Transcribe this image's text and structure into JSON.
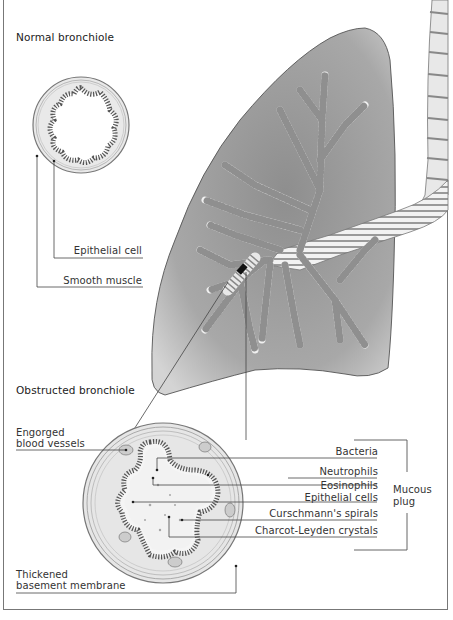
{
  "titles": {
    "normal": "Normal bronchiole",
    "obstructed": "Obstructed bronchiole"
  },
  "normal_labels": {
    "epithelial_cell": "Epithelial cell",
    "smooth_muscle": "Smooth muscle"
  },
  "obstructed_left_labels": {
    "engorged_1": "Engorged",
    "engorged_2": "blood vessels",
    "thickened_1": "Thickened",
    "thickened_2": "basement membrane"
  },
  "mucous_plug_components": [
    "Bacteria",
    "Neutrophils",
    "Eosinophils",
    "Epithelial cells",
    "Curschmann's spirals",
    "Charcot-Leyden crystals"
  ],
  "bracket_label": {
    "line1": "Mucous",
    "line2": "plug"
  },
  "colors": {
    "lung_fill": "#a9a9a9",
    "line": "#444444",
    "frame": "#777777"
  }
}
